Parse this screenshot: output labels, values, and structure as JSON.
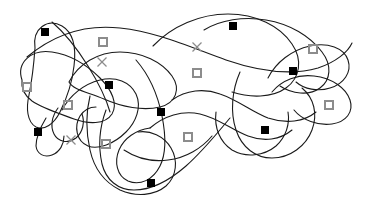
{
  "figure": {
    "width": 366,
    "height": 205,
    "background_color": "#ffffff",
    "curve_color": "#1a1a1a",
    "curve_stroke_width": 1.1,
    "marker_filled_color": "#000000",
    "marker_open_border_color": "#8c8c8c",
    "marker_cross_color": "#8c8c8c",
    "marker_filled_size": 8,
    "marker_open_size": 8,
    "marker_cross_size": 9,
    "marker_open_border_width": 1.6,
    "marker_cross_stroke_width": 1.3
  },
  "legend": {
    "filled_square_label": "filled-square",
    "open_square_label": "open-square",
    "cross_label": "cross"
  },
  "curves": [
    {
      "name": "curve-left-upper-lobe",
      "path": "M 35 48 C 32 28 48 18 62 26 C 74 33 76 50 74 66 C 72 84 66 100 60 112 C 54 124 44 131 36 127 C 27 122 26 108 29 95 C 32 80 34 62 35 48 Z"
    },
    {
      "name": "curve-left-outer-blob",
      "path": "M 22 80 C 16 62 32 49 52 52 C 72 55 88 66 100 78 C 112 90 118 104 112 114 C 105 125 88 124 74 119 C 58 113 42 108 32 101 C 24 95 21 88 22 80 Z"
    },
    {
      "name": "curve-long-upper-sweep",
      "path": "M 27 57 C 52 36 84 24 120 28 C 158 32 192 48 226 60 C 258 71 290 76 318 68 C 336 62 348 52 352 43"
    },
    {
      "name": "curve-central-left-loop",
      "path": "M 62 110 C 70 95 84 84 100 80 C 116 76 130 82 136 94 C 142 107 136 122 126 132 C 114 144 98 150 88 146 C 76 141 74 126 80 116 C 84 110 90 107 96 107"
    },
    {
      "name": "curve-mid-upper-closed",
      "path": "M 69 82 C 78 64 98 52 120 52 C 142 52 162 62 172 76 C 181 89 176 103 160 107 C 143 111 122 107 104 99 C 88 92 73 90 69 82 Z"
    },
    {
      "name": "curve-bottom-left-descender",
      "path": "M 90 96 C 86 112 86 132 90 150 C 94 168 104 182 120 190 C 136 197 154 196 166 186 C 177 176 178 160 171 148 C 164 136 150 130 138 132"
    },
    {
      "name": "curve-bottom-loop-long",
      "path": "M 106 110 C 100 126 98 146 102 164 C 106 180 118 190 134 190 C 152 190 170 180 186 166 C 204 150 218 132 230 118"
    },
    {
      "name": "curve-center-big-s",
      "path": "M 136 60 C 150 76 158 96 162 116 C 166 136 166 154 160 166 C 153 180 140 186 128 181 C 117 176 114 162 119 150 C 124 138 136 130 150 128"
    },
    {
      "name": "curve-mid-right-big-arc",
      "path": "M 153 46 C 172 26 200 14 228 14 C 256 14 280 26 292 44 C 303 60 300 78 286 88 C 272 98 250 98 232 92"
    },
    {
      "name": "curve-right-upper-crescent",
      "path": "M 204 30 C 220 20 244 16 266 20 C 290 24 310 36 322 52 C 332 65 331 80 320 88 C 309 96 292 94 280 86"
    },
    {
      "name": "curve-right-hook-upper",
      "path": "M 268 78 C 276 62 292 50 310 46 C 328 42 344 48 348 60 C 352 72 344 84 330 88 C 318 92 304 89 296 82"
    },
    {
      "name": "curve-right-hook-lower",
      "path": "M 272 92 C 282 80 298 74 314 76 C 332 78 346 88 350 100 C 354 112 346 122 332 124 C 318 126 302 120 294 110"
    },
    {
      "name": "curve-right-lower-loop",
      "path": "M 240 72 C 232 90 230 112 236 130 C 242 148 256 158 272 158 C 290 158 306 146 312 130 C 318 114 314 98 302 88"
    },
    {
      "name": "curve-center-right-wave",
      "path": "M 172 100 C 186 90 204 88 220 94 C 238 100 252 112 268 118 C 286 124 304 122 316 112"
    },
    {
      "name": "curve-center-left-wave",
      "path": "M 150 128 C 164 116 182 110 200 114 C 218 118 232 130 248 136 C 264 142 280 140 292 130"
    },
    {
      "name": "curve-bottom-right-bowl",
      "path": "M 216 112 C 214 128 220 142 232 150 C 246 158 264 156 276 146 C 286 137 290 124 288 112"
    },
    {
      "name": "curve-far-left-tail",
      "path": "M 46 118 C 40 128 36 138 36 146 C 37 154 44 158 52 155 C 60 152 64 144 64 136"
    },
    {
      "name": "curve-left-small-pocket",
      "path": "M 58 108 C 52 116 50 126 54 134 C 58 142 68 144 76 138 C 83 132 85 122 82 114"
    },
    {
      "name": "curve-lower-mid-tie",
      "path": "M 124 150 C 136 158 152 162 168 160 C 186 158 202 148 212 136"
    },
    {
      "name": "curve-upper-left-crossover",
      "path": "M 52 22 C 66 34 78 50 88 66 C 98 82 106 98 110 112"
    }
  ],
  "markers": [
    {
      "name": "marker-filled-1",
      "type": "filled-square",
      "x": 45,
      "y": 32
    },
    {
      "name": "marker-open-1",
      "type": "open-square",
      "x": 103,
      "y": 42
    },
    {
      "name": "marker-cross-1",
      "type": "cross",
      "x": 102,
      "y": 62
    },
    {
      "name": "marker-open-2",
      "type": "open-square",
      "x": 27,
      "y": 87
    },
    {
      "name": "marker-filled-2",
      "type": "filled-square",
      "x": 109,
      "y": 85
    },
    {
      "name": "marker-open-3",
      "type": "open-square",
      "x": 68,
      "y": 105
    },
    {
      "name": "marker-filled-3",
      "type": "filled-square",
      "x": 38,
      "y": 132
    },
    {
      "name": "marker-cross-2",
      "type": "cross",
      "x": 71,
      "y": 140
    },
    {
      "name": "marker-open-4",
      "type": "open-square",
      "x": 106,
      "y": 144
    },
    {
      "name": "marker-filled-4",
      "type": "filled-square",
      "x": 151,
      "y": 183
    },
    {
      "name": "marker-filled-5",
      "type": "filled-square",
      "x": 233,
      "y": 26
    },
    {
      "name": "marker-cross-3",
      "type": "cross",
      "x": 197,
      "y": 47
    },
    {
      "name": "marker-open-5",
      "type": "open-square",
      "x": 197,
      "y": 73
    },
    {
      "name": "marker-filled-6",
      "type": "filled-square",
      "x": 161,
      "y": 112
    },
    {
      "name": "marker-open-6",
      "type": "open-square",
      "x": 188,
      "y": 137
    },
    {
      "name": "marker-open-7",
      "type": "open-square",
      "x": 313,
      "y": 49
    },
    {
      "name": "marker-filled-7",
      "type": "filled-square",
      "x": 293,
      "y": 71
    },
    {
      "name": "marker-open-8",
      "type": "open-square",
      "x": 329,
      "y": 105
    },
    {
      "name": "marker-filled-8",
      "type": "filled-square",
      "x": 265,
      "y": 130
    }
  ]
}
